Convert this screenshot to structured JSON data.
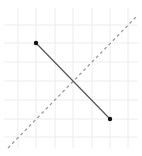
{
  "diagram": {
    "type": "geometry-grid",
    "width": 142,
    "height": 156,
    "colors": {
      "background": "#ffffff",
      "grid": "#ececec",
      "segment": "#555555",
      "point": "#111111",
      "dashed_line": "#9a9a9a"
    },
    "grid": {
      "x_lines": [
        18,
        36,
        55,
        73,
        92,
        110,
        128
      ],
      "y_lines": [
        25,
        43,
        62,
        81,
        100,
        119,
        137
      ],
      "x_min": 4,
      "x_max": 138,
      "y_min": 8,
      "y_max": 148
    },
    "segment": {
      "start": {
        "x": 36,
        "y": 43
      },
      "end": {
        "x": 110,
        "y": 119
      }
    },
    "points": [
      {
        "name": "endpoint-a",
        "x": 36,
        "y": 43
      },
      {
        "name": "endpoint-b",
        "x": 110,
        "y": 119
      }
    ],
    "dashed_line": {
      "start": {
        "x": 8,
        "y": 148
      },
      "end": {
        "x": 136,
        "y": 17
      }
    },
    "intersection": {
      "x": 73,
      "y": 81
    }
  }
}
